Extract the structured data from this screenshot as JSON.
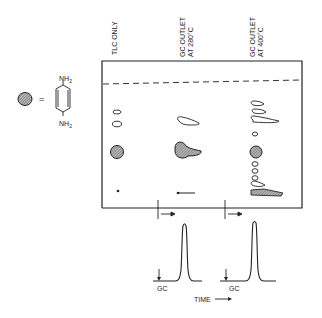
{
  "legend": {
    "equals": "=",
    "compound": {
      "top_group": "NH2",
      "bottom_group": "NH2",
      "top_sub": "2",
      "bottom_sub": "2",
      "group_base": "NH"
    }
  },
  "lanes": [
    {
      "label_line1": "TLC ONLY",
      "label_line2": ""
    },
    {
      "label_line1": "GC OUTLET",
      "label_line2": "AT 280°C"
    },
    {
      "label_line1": "GC OUTLET",
      "label_line2": "AT 400°C"
    }
  ],
  "chromatograms": [
    {
      "label": "GC"
    },
    {
      "label": "GC"
    }
  ],
  "time_axis": {
    "label": "TIME"
  },
  "colors": {
    "ink": "#222222",
    "spot_fill": "#8a8a8a",
    "background": "#ffffff"
  }
}
